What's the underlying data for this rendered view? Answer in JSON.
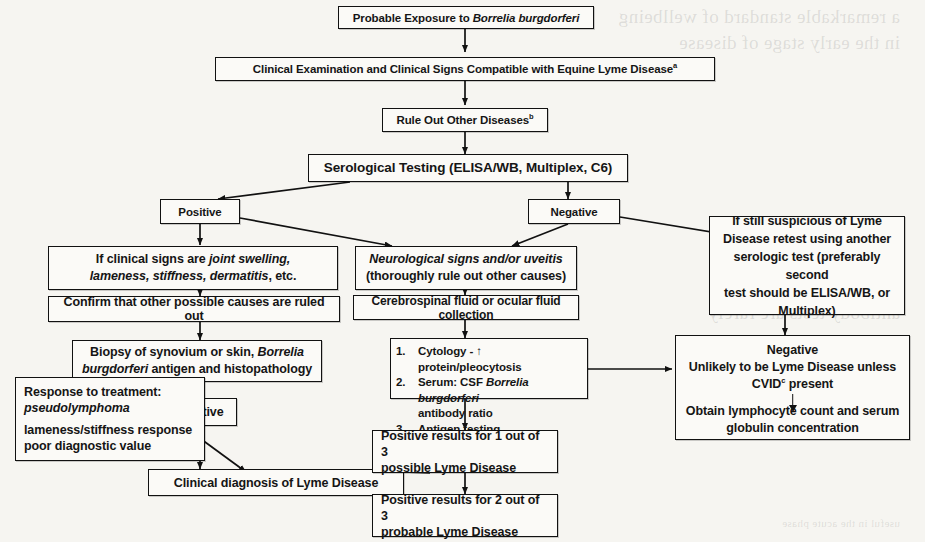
{
  "diagram": {
    "type": "flowchart",
    "background": "#f6f5f1",
    "line_color": "#111111"
  },
  "nodes": {
    "exposure": {
      "text": "Probable Exposure to ",
      "italic": "Borrelia burgdorferi"
    },
    "clinical_exam": {
      "text": "Clinical Examination and Clinical Signs Compatible with Equine Lyme Disease",
      "footnote": "a"
    },
    "rule_out": {
      "text": "Rule Out Other Diseases",
      "footnote": "b"
    },
    "serology": {
      "text": "Serological Testing (ELISA/WB, Multiplex, C6)"
    },
    "positive": {
      "text": "Positive"
    },
    "negative": {
      "text": "Negative"
    },
    "clinical_signs": {
      "line1_pre": "If clinical signs are ",
      "line1_italic": "joint swelling,",
      "line2_italic": "lameness, stiffness, dermatitis",
      "line2_post": ", etc."
    },
    "confirm_causes": {
      "text": "Confirm that other possible causes are ruled out"
    },
    "biopsy": {
      "line1_pre": "Biopsy of synovium or skin, ",
      "line1_italic": "Borrelia",
      "line2_italic": "burgdorferi",
      "line2_post": " antigen and histopathology"
    },
    "positive2": {
      "text": "Positive"
    },
    "response": {
      "line1": "Response to treatment:",
      "line2_italic": "pseudolymphoma",
      "line3": "lameness/stiffness response",
      "line4": "poor diagnostic value"
    },
    "clinical_diagnosis": {
      "text": "Clinical diagnosis of Lyme Disease"
    },
    "neuro": {
      "line1_italic": "Neurological signs and/or uveitis",
      "line2": "(thoroughly rule out other causes)"
    },
    "csf": {
      "text": "Cerebrospinal fluid or ocular fluid collection"
    },
    "tests": {
      "items": [
        {
          "num": "1.",
          "pre": "Cytology - ↑ protein/pleocytosis",
          "italic": "",
          "post": ""
        },
        {
          "num": "2.",
          "pre": "Serum: CSF ",
          "italic": "Borrelia burgdorferi",
          "post": "antibody ratio"
        },
        {
          "num": "3.",
          "pre": "Antigen testing",
          "italic": "",
          "post": ""
        }
      ]
    },
    "result_1of3": {
      "line1": "Positive results for 1 out of 3",
      "line2": "possible Lyme Disease"
    },
    "result_2of3": {
      "line1": "Positive results for 2 out of 3",
      "line2": "probable Lyme Disease"
    },
    "retest": {
      "line1": "If still suspicious of Lyme",
      "line2": "Disease retest using another",
      "line3": "serologic test (preferably second",
      "line4": "test should be ELISA/WB, or",
      "line5": "Multiplex)"
    },
    "neg_result": {
      "line1": "Negative",
      "line2": "Unlikely to be Lyme Disease unless",
      "line3_pre": "CVID",
      "line3_footnote": "c",
      "line3_post": " present",
      "line4": "Obtain lymphocyte count and serum",
      "line5": "globulin concentration"
    }
  },
  "bleed_text": {
    "row1": "a remarkable standard of wellbeing",
    "row2": "in the early stage of disease",
    "row3": "antibody tests are rarely",
    "row4": "useful in the acute phase"
  }
}
